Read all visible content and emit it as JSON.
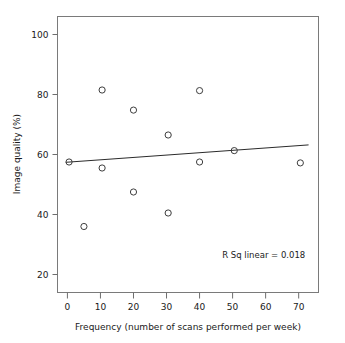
{
  "chart_data": {
    "type": "scatter",
    "title": "",
    "xlabel": "Frequency (number of scans performed per week)",
    "ylabel": "Image quality (%)",
    "xlim": [
      -3,
      76
    ],
    "ylim": [
      14,
      106
    ],
    "xticks": [
      0,
      10,
      20,
      30,
      40,
      50,
      60,
      70
    ],
    "xtick_labels": [
      "0",
      "10",
      "20",
      "30",
      "40",
      "50",
      "60",
      "70"
    ],
    "yticks": [
      20,
      40,
      60,
      80,
      100
    ],
    "ytick_labels": [
      "20",
      "40",
      "60",
      "80",
      "100"
    ],
    "grid": false,
    "legend": null,
    "marker": "open-circle",
    "points": [
      {
        "x": 0.5,
        "y": 57.5
      },
      {
        "x": 5.0,
        "y": 36.0
      },
      {
        "x": 10.5,
        "y": 81.5
      },
      {
        "x": 10.5,
        "y": 55.5
      },
      {
        "x": 20.0,
        "y": 74.8
      },
      {
        "x": 20.0,
        "y": 47.5
      },
      {
        "x": 30.5,
        "y": 66.5
      },
      {
        "x": 30.5,
        "y": 40.5
      },
      {
        "x": 40.0,
        "y": 81.3
      },
      {
        "x": 40.0,
        "y": 57.5
      },
      {
        "x": 50.5,
        "y": 61.3
      },
      {
        "x": 70.5,
        "y": 57.2
      }
    ],
    "fit_line": {
      "type": "linear-regression",
      "x_start": -0.5,
      "y_start": 57.4,
      "x_end": 73.0,
      "y_end": 63.2
    },
    "annotations": [
      {
        "name": "r-squared",
        "text": "R Sq linear = 0.018",
        "x": 72.0,
        "y": 25.5
      }
    ]
  }
}
